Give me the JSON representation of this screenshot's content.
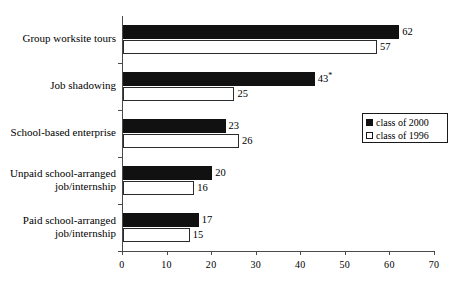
{
  "chart_data": {
    "type": "bar",
    "orientation": "horizontal",
    "title": "",
    "subtitle": "",
    "xlabel": "",
    "ylabel": "",
    "xlim": [
      0,
      70
    ],
    "xticks": [
      "0",
      "10",
      "20",
      "30",
      "40",
      "50",
      "60",
      "70"
    ],
    "xtick_values": [
      0,
      10,
      20,
      30,
      40,
      50,
      60,
      70
    ],
    "grid": false,
    "legend_position": "right-middle",
    "categories": [
      "Group worksite tours",
      "Job shadowing",
      "School-based enterprise",
      "Unpaid school-arranged job/internship",
      "Paid school-arranged job/internship"
    ],
    "category_lines": [
      [
        "Group worksite tours"
      ],
      [
        "Job shadowing"
      ],
      [
        "School-based enterprise"
      ],
      [
        "Unpaid school-arranged",
        "job/internship"
      ],
      [
        "Paid school-arranged",
        "job/internship"
      ]
    ],
    "series": [
      {
        "name": "class of 2000",
        "color": "#111111",
        "values": [
          62,
          43,
          23,
          20,
          17
        ],
        "labels": [
          "62",
          "43",
          "23",
          "20",
          "17"
        ],
        "annotations": [
          "",
          "*",
          "",
          "",
          ""
        ]
      },
      {
        "name": "class of 1996",
        "color": "#ffffff",
        "values": [
          57,
          25,
          26,
          16,
          15
        ],
        "labels": [
          "57",
          "25",
          "26",
          "16",
          "15"
        ],
        "annotations": [
          "",
          "",
          "",
          "",
          ""
        ]
      }
    ]
  },
  "legend": {
    "entries": [
      {
        "label": "class of 2000",
        "swatch": "filled-black-square"
      },
      {
        "label": "class of 1996",
        "swatch": "open-white-square"
      }
    ]
  },
  "colors": {
    "series_2000": "#111111",
    "series_1996": "#ffffff",
    "axis": "#4a4a4a",
    "outline": "#1a1a1a",
    "background": "#ffffff"
  }
}
